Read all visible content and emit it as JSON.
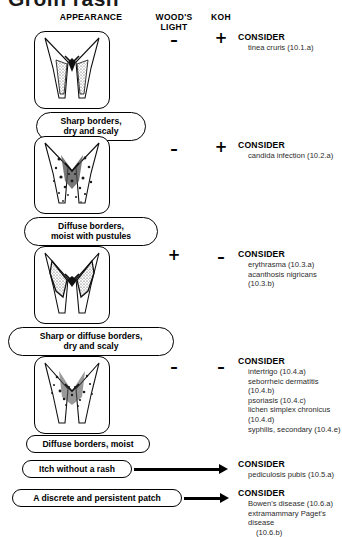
{
  "title": "Groin rash",
  "headers": {
    "appearance": "APPEARANCE",
    "woods_light": "WOOD'S\nLIGHT",
    "koh": "KOH"
  },
  "labels": {
    "consider": "CONSIDER"
  },
  "rows": [
    {
      "caption": "Sharp borders,\ndry and scaly",
      "woods_light": "–",
      "koh": "+",
      "consider_head": "CONSIDER",
      "items": [
        "tinea cruris (10.1.a)"
      ],
      "illustration": "groin-sharp-scaly-icon"
    },
    {
      "caption": "Diffuse borders,\nmoist with pustules",
      "woods_light": "–",
      "koh": "+",
      "consider_head": "CONSIDER",
      "items": [
        "candida infection (10.2.a)"
      ],
      "illustration": "groin-pustules-icon"
    },
    {
      "caption": "Sharp or diffuse borders,\ndry and scaly",
      "woods_light": "+",
      "koh": "–",
      "consider_head": "CONSIDER",
      "items": [
        "erythrasma (10.3.a)",
        "acanthosis nigricans (10.3.b)"
      ],
      "illustration": "groin-erythrasma-icon"
    },
    {
      "caption": "Diffuse borders, moist",
      "woods_light": "–",
      "koh": "–",
      "consider_head": "CONSIDER",
      "items": [
        "intertrigo (10.4.a)",
        "seborrheic dermatitis (10.4.b)",
        "psoriasis (10.4.c)",
        "lichen simplex chronicus (10.4.d)",
        "syphilis, secondary (10.4.e)"
      ],
      "illustration": "groin-intertrigo-icon"
    }
  ],
  "extra_rows": [
    {
      "caption": "Itch without a rash",
      "consider_head": "CONSIDER",
      "items": [
        "pediculosis pubis (10.5.a)"
      ]
    },
    {
      "caption": "A discrete and persistent patch",
      "consider_head": "CONSIDER",
      "items": [
        "Bowen's disease (10.6.a)",
        "extramammary Paget's disease",
        "(10.6.b)"
      ]
    }
  ]
}
